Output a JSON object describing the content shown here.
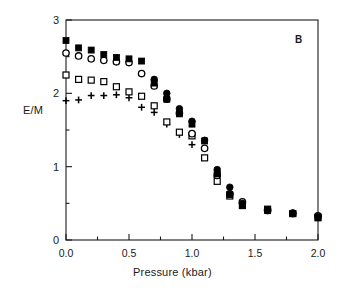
{
  "chart_data": {
    "type": "scatter",
    "title": "",
    "panel_label": "B",
    "xlabel": "Pressure  (kbar)",
    "ylabel": "E/M",
    "xlim": [
      0.0,
      2.0
    ],
    "ylim": [
      0,
      3
    ],
    "xticks": [
      0.0,
      0.5,
      1.0,
      1.5,
      2.0
    ],
    "xtick_labels": [
      "0.0",
      "0.5",
      "1.0",
      "1.5",
      "2.0"
    ],
    "xminor_step": 0.25,
    "yticks": [
      0,
      1,
      2,
      3
    ],
    "ytick_labels": [
      "0",
      "1",
      "2",
      "3"
    ],
    "yminor_step": 0.5,
    "grid": false,
    "legend": "none",
    "frame": "box",
    "series": [
      {
        "name": "filled-square",
        "marker": "filled-square",
        "color": "#000000",
        "points": [
          [
            0.0,
            2.72
          ],
          [
            0.1,
            2.62
          ],
          [
            0.2,
            2.59
          ],
          [
            0.3,
            2.53
          ],
          [
            0.4,
            2.49
          ],
          [
            0.5,
            2.47
          ],
          [
            0.6,
            2.44
          ],
          [
            0.7,
            2.14
          ],
          [
            0.8,
            1.92
          ],
          [
            0.9,
            1.72
          ],
          [
            1.0,
            1.58
          ],
          [
            1.1,
            1.35
          ],
          [
            1.2,
            0.9
          ],
          [
            1.3,
            0.62
          ],
          [
            1.4,
            0.47
          ],
          [
            1.6,
            0.4
          ],
          [
            1.8,
            0.36
          ],
          [
            2.0,
            0.3
          ]
        ]
      },
      {
        "name": "open-circle",
        "marker": "open-circle",
        "color": "#000000",
        "points": [
          [
            0.0,
            2.55
          ],
          [
            0.1,
            2.51
          ],
          [
            0.2,
            2.47
          ],
          [
            0.3,
            2.45
          ],
          [
            0.4,
            2.43
          ],
          [
            0.5,
            2.42
          ],
          [
            0.6,
            2.27
          ],
          [
            0.7,
            2.1
          ],
          [
            0.8,
            1.92
          ],
          [
            0.9,
            1.73
          ],
          [
            1.0,
            1.45
          ],
          [
            1.1,
            1.25
          ],
          [
            1.2,
            0.88
          ],
          [
            1.3,
            0.63
          ],
          [
            1.4,
            0.52
          ],
          [
            1.6,
            0.41
          ],
          [
            1.8,
            0.36
          ],
          [
            2.0,
            0.33
          ]
        ]
      },
      {
        "name": "filled-circle",
        "marker": "filled-circle",
        "color": "#000000",
        "points": [
          [
            0.7,
            2.19
          ],
          [
            0.8,
            2.0
          ],
          [
            0.9,
            1.79
          ],
          [
            1.0,
            1.62
          ],
          [
            1.1,
            1.36
          ],
          [
            1.2,
            0.96
          ],
          [
            1.3,
            0.72
          ],
          [
            1.4,
            0.5
          ],
          [
            1.6,
            0.4
          ],
          [
            1.8,
            0.37
          ],
          [
            2.0,
            0.32
          ]
        ]
      },
      {
        "name": "open-square",
        "marker": "open-square",
        "color": "#000000",
        "points": [
          [
            0.0,
            2.25
          ],
          [
            0.1,
            2.19
          ],
          [
            0.2,
            2.18
          ],
          [
            0.3,
            2.16
          ],
          [
            0.4,
            2.09
          ],
          [
            0.5,
            2.02
          ],
          [
            0.6,
            1.96
          ],
          [
            0.7,
            1.83
          ],
          [
            0.8,
            1.61
          ],
          [
            0.9,
            1.47
          ],
          [
            1.0,
            1.42
          ],
          [
            1.1,
            1.12
          ],
          [
            1.2,
            0.8
          ],
          [
            1.3,
            0.6
          ],
          [
            1.4,
            0.47
          ],
          [
            1.6,
            0.42
          ],
          [
            1.8,
            0.36
          ],
          [
            2.0,
            0.31
          ]
        ]
      },
      {
        "name": "plus",
        "marker": "plus",
        "color": "#000000",
        "points": [
          [
            0.0,
            1.9
          ],
          [
            0.1,
            1.91
          ],
          [
            0.2,
            1.97
          ],
          [
            0.3,
            1.97
          ],
          [
            0.4,
            1.98
          ],
          [
            0.5,
            1.94
          ],
          [
            0.6,
            1.81
          ],
          [
            0.7,
            1.74
          ],
          [
            0.8,
            1.58
          ],
          [
            0.9,
            1.44
          ],
          [
            1.0,
            1.3
          ],
          [
            1.2,
            0.92
          ],
          [
            1.3,
            0.62
          ]
        ]
      }
    ]
  }
}
